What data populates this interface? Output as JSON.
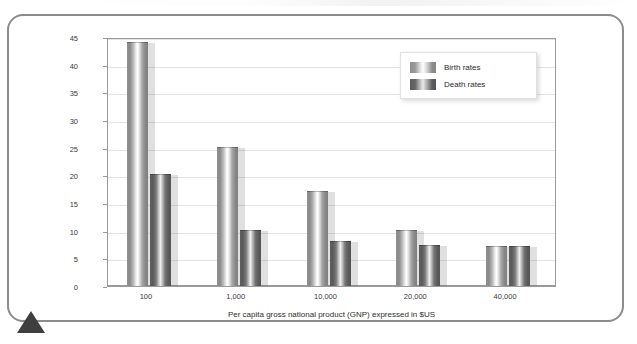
{
  "figure": {
    "frame_border_color": "#8c8c8c",
    "marker": "triangle-up"
  },
  "chart_data": {
    "type": "bar",
    "title": "",
    "categories": [
      "100",
      "1,000",
      "10,000",
      "20,000",
      "40,000"
    ],
    "series": [
      {
        "name": "Birth rates",
        "values": [
          44,
          25,
          17,
          10,
          7
        ],
        "color": "#9a9a9a"
      },
      {
        "name": "Death rates",
        "values": [
          20,
          10,
          8,
          7.3,
          7
        ],
        "color": "#5f5f5f"
      }
    ],
    "xlabel": "Per capita gross national product (GNP) expressed in $US",
    "ylabel": "Birth rate and death rate (per 1,000 of population)",
    "ylim": [
      0,
      45
    ],
    "yticks": [
      0,
      5,
      10,
      15,
      20,
      25,
      30,
      35,
      40,
      45
    ],
    "ytick_labels": [
      "0",
      "5",
      "10",
      "15",
      "20",
      "25",
      "30",
      "35",
      "40",
      "45"
    ],
    "grid": true,
    "legend_position": "upper right"
  }
}
